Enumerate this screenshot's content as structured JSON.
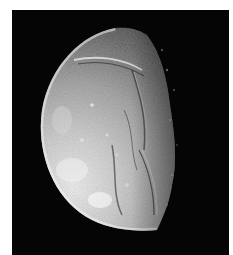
{
  "image": {
    "subject": "Icy moon in partial phase, heavily fractured surface with canyons and ridges",
    "alt": "Grayscale photograph of a crescent-to-gibbous moon against black space",
    "colors": {
      "border": "#ffffff",
      "space": "#050505",
      "surface_bright": "#e6e6e6",
      "surface_mid": "#9a9a9a",
      "surface_dark": "#3a3a3a"
    }
  }
}
